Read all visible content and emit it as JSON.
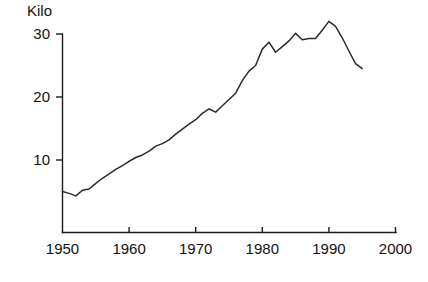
{
  "chart_data": {
    "type": "line",
    "title": "",
    "subtitle": "",
    "xlabel": "",
    "ylabel": "Kilo",
    "unit_label": "Kilo",
    "xlim": [
      1950,
      2000
    ],
    "ylim": [
      0,
      33.5
    ],
    "xticks": [
      1950,
      1960,
      1970,
      1980,
      1990,
      2000
    ],
    "xtick_labels": [
      "1950",
      "1960",
      "1970",
      "1980",
      "1990",
      "2000"
    ],
    "yticks": [
      10,
      20,
      30
    ],
    "ytick_labels": [
      "10",
      "20",
      "30"
    ],
    "grid": false,
    "legend": false,
    "legend_position": "none",
    "line_color": "#2b2b2b",
    "axis_color": "#1c1c1c",
    "background_color": "#ffffff",
    "series": [
      {
        "name": "Kilo",
        "x": [
          1950,
          1951,
          1952,
          1953,
          1954,
          1955,
          1956,
          1957,
          1958,
          1959,
          1960,
          1961,
          1962,
          1963,
          1964,
          1965,
          1966,
          1967,
          1968,
          1969,
          1970,
          1971,
          1972,
          1973,
          1974,
          1975,
          1976,
          1977,
          1978,
          1979,
          1980,
          1981,
          1982,
          1983,
          1984,
          1985,
          1986,
          1987,
          1988,
          1989,
          1990,
          1991,
          1992,
          1993,
          1994,
          1995
        ],
        "values": [
          5.0,
          4.7,
          4.3,
          5.2,
          5.4,
          6.3,
          7.1,
          7.8,
          8.5,
          9.1,
          9.8,
          10.4,
          10.8,
          11.4,
          12.2,
          12.6,
          13.2,
          14.1,
          14.9,
          15.7,
          16.4,
          17.4,
          18.1,
          17.6,
          18.6,
          19.6,
          20.6,
          22.6,
          24.1,
          25.0,
          27.6,
          28.7,
          27.1,
          28.0,
          28.9,
          30.1,
          29.1,
          29.3,
          29.3,
          30.6,
          32.0,
          31.2,
          29.4,
          27.3,
          25.3,
          24.5
        ]
      }
    ]
  },
  "axes": {
    "y_unit_label": "Kilo"
  }
}
